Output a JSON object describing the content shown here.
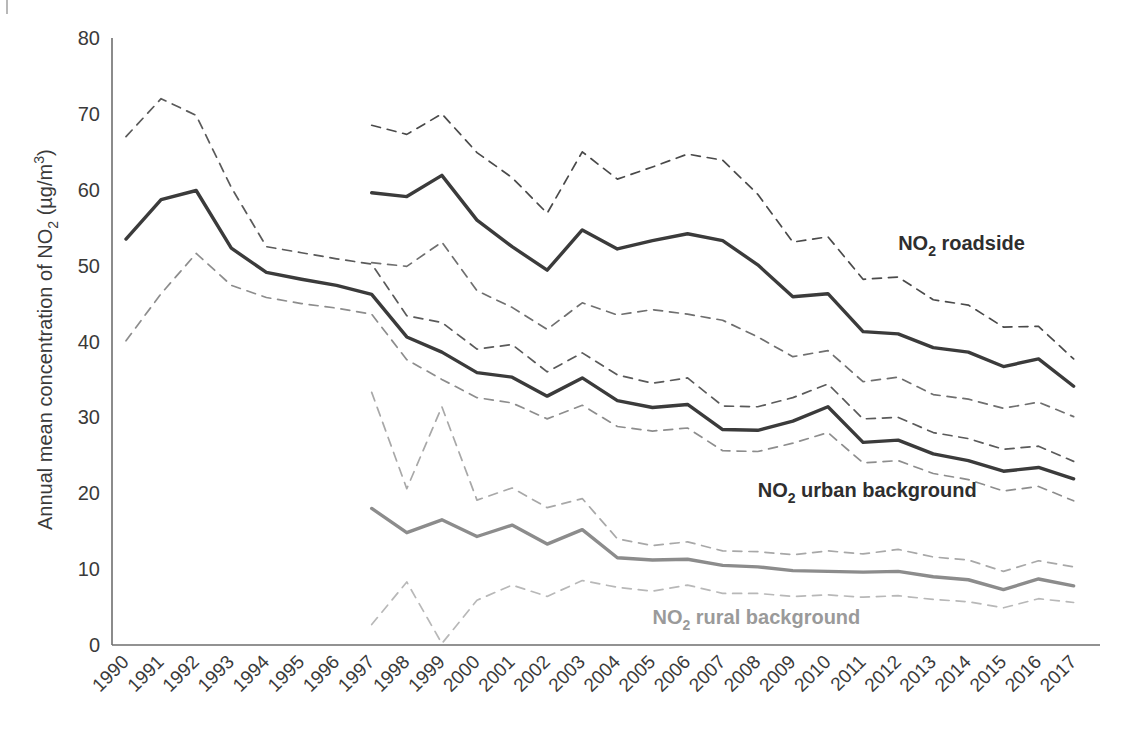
{
  "chart_data": {
    "type": "line",
    "title": "",
    "xlabel": "",
    "ylabel": "Annual mean concentration of NO2 (µg/m3)",
    "ylabel_parts": {
      "lead": "Annual mean concentration of NO",
      "sub1": "2",
      "mid": " (µg/m",
      "sup": "3",
      "tail": ")"
    },
    "ylim": [
      0,
      80
    ],
    "yticks": [
      0,
      10,
      20,
      30,
      40,
      50,
      60,
      70,
      80
    ],
    "ytick_labels": [
      "0",
      "10",
      "20",
      "30",
      "40",
      "50",
      "60",
      "70",
      "80"
    ],
    "grid": false,
    "legend_position": "inline-annotations",
    "categories": [
      "1990",
      "1991",
      "1992",
      "1993",
      "1994",
      "1995",
      "1996",
      "1997",
      "1998",
      "1999",
      "2000",
      "2001",
      "2002",
      "2003",
      "2004",
      "2005",
      "2006",
      "2007",
      "2008",
      "2009",
      "2010",
      "2011",
      "2012",
      "2013",
      "2014",
      "2015",
      "2016",
      "2017"
    ],
    "series": [
      {
        "name": "NO2 roadside",
        "style": "solid",
        "color": "#3b3b3b",
        "label_parts": {
          "lead": "NO",
          "sub": "2",
          "tail": " roadside"
        },
        "x": [
          "1997",
          "1998",
          "1999",
          "2000",
          "2001",
          "2002",
          "2003",
          "2004",
          "2005",
          "2006",
          "2007",
          "2008",
          "2009",
          "2010",
          "2011",
          "2012",
          "2013",
          "2014",
          "2015",
          "2016",
          "2017"
        ],
        "values": [
          59.6,
          59.1,
          61.9,
          56.0,
          52.5,
          49.4,
          54.7,
          52.2,
          53.3,
          54.2,
          53.3,
          50.1,
          45.9,
          46.3,
          41.3,
          41.0,
          39.2,
          38.6,
          36.7,
          37.7,
          34.1
        ]
      },
      {
        "name": "NO2 roadside upper bound",
        "style": "dashed",
        "color": "#4a4a4a",
        "x": [
          "1997",
          "1998",
          "1999",
          "2000",
          "2001",
          "2002",
          "2003",
          "2004",
          "2005",
          "2006",
          "2007",
          "2008",
          "2009",
          "2010",
          "2011",
          "2012",
          "2013",
          "2014",
          "2015",
          "2016",
          "2017"
        ],
        "values": [
          68.5,
          67.3,
          70.0,
          64.9,
          61.6,
          56.9,
          65.0,
          61.4,
          63.0,
          64.7,
          63.9,
          59.4,
          53.1,
          53.8,
          48.2,
          48.5,
          45.5,
          44.8,
          41.9,
          42.0,
          37.7
        ]
      },
      {
        "name": "NO2 roadside lower bound",
        "style": "dashed",
        "color": "#6f6f6f",
        "x": [
          "1997",
          "1998",
          "1999",
          "2000",
          "2001",
          "2002",
          "2003",
          "2004",
          "2005",
          "2006",
          "2007",
          "2008",
          "2009",
          "2010",
          "2011",
          "2012",
          "2013",
          "2014",
          "2015",
          "2016",
          "2017"
        ],
        "values": [
          50.4,
          49.9,
          53.1,
          46.7,
          44.5,
          41.6,
          45.1,
          43.5,
          44.2,
          43.6,
          42.8,
          40.6,
          38.0,
          38.8,
          34.7,
          35.3,
          33.0,
          32.4,
          31.2,
          32.0,
          30.1
        ]
      },
      {
        "name": "NO2 urban background",
        "style": "solid",
        "color": "#3b3b3b",
        "label_parts": {
          "lead": "NO",
          "sub": "2",
          "tail": " urban background"
        },
        "x": [
          "1990",
          "1991",
          "1992",
          "1993",
          "1994",
          "1995",
          "1996",
          "1997",
          "1998",
          "1999",
          "2000",
          "2001",
          "2002",
          "2003",
          "2004",
          "2005",
          "2006",
          "2007",
          "2008",
          "2009",
          "2010",
          "2011",
          "2012",
          "2013",
          "2014",
          "2015",
          "2016",
          "2017"
        ],
        "values": [
          53.5,
          58.7,
          59.9,
          52.3,
          49.1,
          48.2,
          47.4,
          46.2,
          40.6,
          38.6,
          35.9,
          35.3,
          32.8,
          35.2,
          32.2,
          31.3,
          31.7,
          28.4,
          28.3,
          29.5,
          31.4,
          26.7,
          27.0,
          25.2,
          24.3,
          22.9,
          23.4,
          21.9
        ]
      },
      {
        "name": "NO2 urban background upper bound",
        "style": "dashed",
        "color": "#5a5a5a",
        "x": [
          "1990",
          "1991",
          "1992",
          "1993",
          "1994",
          "1995",
          "1996",
          "1997",
          "1998",
          "1999",
          "2000",
          "2001",
          "2002",
          "2003",
          "2004",
          "2005",
          "2006",
          "2007",
          "2008",
          "2009",
          "2010",
          "2011",
          "2012",
          "2013",
          "2014",
          "2015",
          "2016",
          "2017"
        ],
        "values": [
          67.0,
          72.0,
          69.8,
          60.3,
          52.5,
          51.7,
          50.9,
          50.2,
          43.4,
          42.5,
          39.0,
          39.6,
          36.0,
          38.5,
          35.6,
          34.5,
          35.2,
          31.5,
          31.4,
          32.6,
          34.4,
          29.8,
          30.0,
          28.0,
          27.2,
          25.8,
          26.2,
          24.2
        ]
      },
      {
        "name": "NO2 urban background lower bound",
        "style": "dashed",
        "color": "#8d8d8d",
        "x": [
          "1990",
          "1991",
          "1992",
          "1993",
          "1994",
          "1995",
          "1996",
          "1997",
          "1998",
          "1999",
          "2000",
          "2001",
          "2002",
          "2003",
          "2004",
          "2005",
          "2006",
          "2007",
          "2008",
          "2009",
          "2010",
          "2011",
          "2012",
          "2013",
          "2014",
          "2015",
          "2016",
          "2017"
        ],
        "values": [
          40.1,
          46.3,
          51.6,
          47.4,
          45.8,
          45.0,
          44.4,
          43.6,
          37.6,
          35.0,
          32.6,
          31.9,
          29.8,
          31.6,
          28.8,
          28.2,
          28.6,
          25.6,
          25.5,
          26.6,
          28.0,
          24.0,
          24.3,
          22.6,
          21.8,
          20.3,
          20.9,
          19.0
        ]
      },
      {
        "name": "NO2 rural background",
        "style": "solid",
        "color": "#8c8c8c",
        "label_parts": {
          "lead": "NO",
          "sub": "2",
          "tail": " rural background"
        },
        "x": [
          "1997",
          "1998",
          "1999",
          "2000",
          "2001",
          "2002",
          "2003",
          "2004",
          "2005",
          "2006",
          "2007",
          "2008",
          "2009",
          "2010",
          "2011",
          "2012",
          "2013",
          "2014",
          "2015",
          "2016",
          "2017"
        ],
        "values": [
          18.0,
          14.8,
          16.5,
          14.3,
          15.8,
          13.3,
          15.2,
          11.5,
          11.2,
          11.3,
          10.5,
          10.3,
          9.8,
          9.7,
          9.6,
          9.7,
          9.0,
          8.6,
          7.3,
          8.7,
          7.8
        ]
      },
      {
        "name": "NO2 rural background upper bound",
        "style": "dashed",
        "color": "#a8a8a8",
        "x": [
          "1997",
          "1998",
          "1999",
          "2000",
          "2001",
          "2002",
          "2003",
          "2004",
          "2005",
          "2006",
          "2007",
          "2008",
          "2009",
          "2010",
          "2011",
          "2012",
          "2013",
          "2014",
          "2015",
          "2016",
          "2017"
        ],
        "values": [
          33.3,
          20.6,
          31.4,
          19.1,
          20.7,
          18.1,
          19.3,
          14.0,
          13.1,
          13.6,
          12.4,
          12.3,
          11.9,
          12.4,
          12.0,
          12.6,
          11.6,
          11.2,
          9.7,
          11.1,
          10.3
        ]
      },
      {
        "name": "NO2 rural background lower bound",
        "style": "dashed",
        "color": "#b8b8b8",
        "x": [
          "1997",
          "1998",
          "1999",
          "2000",
          "2001",
          "2002",
          "2003",
          "2004",
          "2005",
          "2006",
          "2007",
          "2008",
          "2009",
          "2010",
          "2011",
          "2012",
          "2013",
          "2014",
          "2015",
          "2016",
          "2017"
        ],
        "values": [
          2.7,
          8.3,
          0.2,
          5.9,
          7.9,
          6.4,
          8.5,
          7.6,
          7.1,
          7.9,
          6.8,
          6.8,
          6.4,
          6.6,
          6.3,
          6.5,
          6.0,
          5.7,
          4.9,
          6.1,
          5.6
        ]
      }
    ],
    "annotations": [
      {
        "id": "roadside",
        "text": "NO2 roadside",
        "x_year": "2012",
        "y_value": 52.0
      },
      {
        "id": "urban",
        "text": "NO2 urban background",
        "x_year": "2008",
        "y_value": 19.5
      },
      {
        "id": "rural",
        "text": "NO2 rural background",
        "x_year": "2005",
        "y_value": 2.8
      }
    ]
  }
}
